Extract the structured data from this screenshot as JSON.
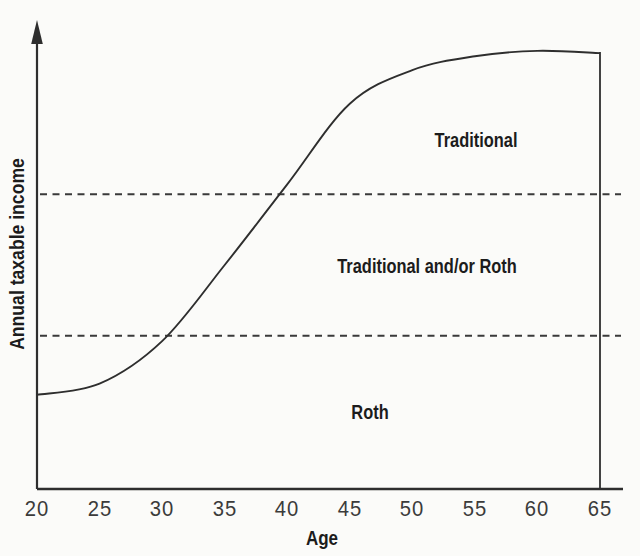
{
  "colors": {
    "line": "#2e2e2e",
    "dashed_line": "#3a3a3a",
    "label_text": "#1c1c1c",
    "tick_text": "#3b3b3b",
    "background": "#fbfbf9"
  },
  "chart_data": {
    "type": "line",
    "title": "",
    "xlabel": "Age",
    "ylabel": "Annual taxable income",
    "xlim": [
      20,
      65
    ],
    "x_ticks": [
      20,
      25,
      30,
      35,
      40,
      45,
      50,
      55,
      60,
      65
    ],
    "y_axis": "unlabeled relative scale 0-100, arrow pointing up, no tick marks",
    "grid": "off",
    "legend": "none",
    "series": [
      {
        "name": "annual-taxable-income-curve",
        "style": "solid s-curve",
        "x": [
          20,
          25,
          30,
          35,
          40,
          45,
          50,
          55,
          60,
          65
        ],
        "y_relative": [
          21,
          23.5,
          33,
          50,
          68,
          86,
          93.5,
          96.6,
          97.8,
          97.3
        ]
      }
    ],
    "thresholds": [
      {
        "name": "upper-threshold",
        "style": "dashed",
        "y_relative": 65.8
      },
      {
        "name": "lower-threshold",
        "style": "dashed",
        "y_relative": 34.2
      }
    ],
    "regions": [
      {
        "label": "Traditional",
        "location": "above upper dashed line"
      },
      {
        "label": "Traditional and/or Roth",
        "location": "between dashed lines"
      },
      {
        "label": "Roth",
        "location": "below lower dashed line"
      }
    ],
    "right_boundary": "vertical solid line at age 65 from curve end down to x-axis"
  }
}
